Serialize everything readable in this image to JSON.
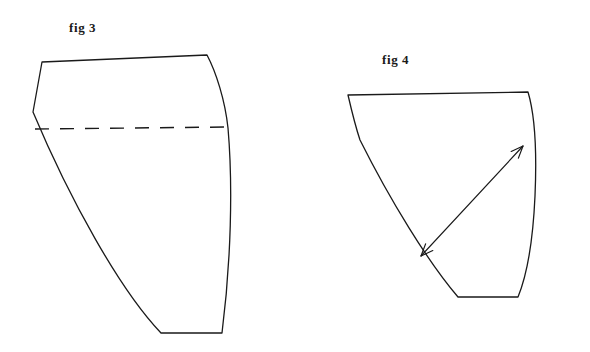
{
  "page": {
    "background_color": "#ffffff",
    "ink_color": "#1a1a1a",
    "width": 590,
    "height": 352
  },
  "figures": [
    {
      "id": "fig3",
      "label": "fig 3",
      "label_x": 69,
      "label_y": 20,
      "description": "Curved quadrilateral pattern piece with a horizontal dashed fold line across the upper third",
      "outline_path": "M 42 62 L 207 55 C 216 72 225 100 228 128 C 233 186 231 262 222 333 L 161 333 C 120 290 70 200 33 112 Z",
      "dashed_line": {
        "x1": 35,
        "y1": 129,
        "x2": 228,
        "y2": 127,
        "dash_pattern": "14 11",
        "stroke_width": 1.4
      },
      "vertices": [
        {
          "name": "top-left",
          "x": 42,
          "y": 62
        },
        {
          "name": "top-right",
          "x": 207,
          "y": 55
        },
        {
          "name": "left-kink",
          "x": 33,
          "y": 112
        },
        {
          "name": "bottom-left",
          "x": 161,
          "y": 333
        },
        {
          "name": "bottom-right",
          "x": 222,
          "y": 333
        }
      ]
    },
    {
      "id": "fig4",
      "label": "fig 4",
      "label_x": 382,
      "label_y": 52,
      "description": "Curved quadrilateral pattern piece with a double-headed arrow showing the bias direction",
      "outline_path": "M 348 95 L 528 92 C 534 112 537 150 535 196 C 533 240 527 275 518 297 L 458 297 C 428 262 390 200 360 140 C 355 125 351 108 348 95 Z",
      "vertices": [
        {
          "name": "top-left",
          "x": 348,
          "y": 95
        },
        {
          "name": "top-right",
          "x": 528,
          "y": 92
        },
        {
          "name": "bottom-left",
          "x": 458,
          "y": 297
        },
        {
          "name": "bottom-right",
          "x": 518,
          "y": 297
        }
      ],
      "arrow": {
        "name": "bias-direction-arrow",
        "x1": 421,
        "y1": 256,
        "x2": 523,
        "y2": 146,
        "double_headed": true,
        "stroke_width": 1.2,
        "head_length": 13,
        "head_angle_deg": 22
      }
    }
  ],
  "stroke": {
    "outline_width": 1.3,
    "color": "#1a1a1a"
  }
}
